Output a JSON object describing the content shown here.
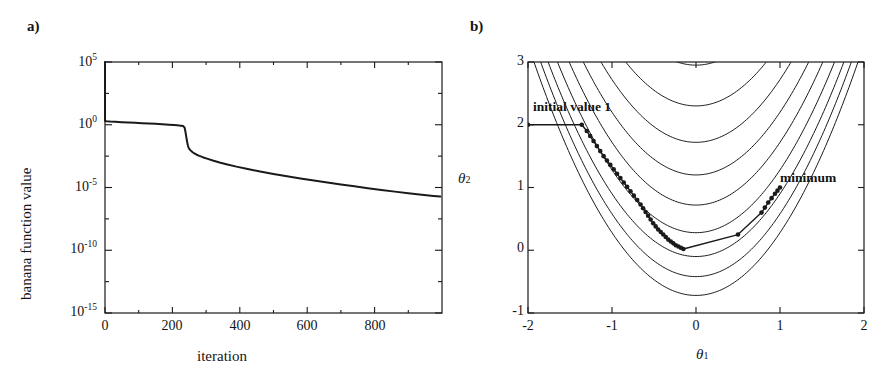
{
  "figure": {
    "background": "#ffffff",
    "ink_color": "#1a1a1a"
  },
  "panels": [
    {
      "key": "a",
      "label": "a)",
      "xlabel": "iteration",
      "ylabel": "banana function value"
    },
    {
      "key": "b",
      "label": "b)",
      "xlabel": "θ",
      "xlabel_sub": "1",
      "ylabel": "θ",
      "ylabel_sub": "2"
    }
  ],
  "annotations": {
    "initial_value": "initial value 1",
    "minimum": "minimum"
  },
  "chart_data": [
    {
      "type": "line",
      "panel": "a",
      "title": "a)",
      "xlabel": "iteration",
      "ylabel": "banana function value",
      "xlim": [
        0,
        1000
      ],
      "ylim": [
        1e-15,
        100000.0
      ],
      "yscale": "log",
      "xscale": "linear",
      "grid": false,
      "legend": null,
      "xticks": [
        0,
        200,
        400,
        600,
        800
      ],
      "xticklabels": [
        "0",
        "200",
        "400",
        "600",
        "800"
      ],
      "yticks": [
        100000.0,
        1,
        1e-05,
        1e-10,
        1e-15
      ],
      "yticklabels": [
        "10^5",
        "10^0",
        "10^-5",
        "10^-10",
        "10^-15"
      ],
      "minor_yticks_per_decade": 1,
      "series": [
        {
          "name": "banana function value",
          "x": [
            0,
            5,
            15,
            30,
            50,
            70,
            90,
            110,
            130,
            150,
            170,
            190,
            205,
            215,
            225,
            232,
            236,
            238,
            240,
            242,
            244,
            246,
            248,
            250,
            253,
            256,
            260,
            265,
            272,
            280,
            290,
            305,
            320,
            340,
            360,
            390,
            420,
            460,
            500,
            540,
            580,
            620,
            660,
            700,
            740,
            780,
            820,
            860,
            900,
            940,
            975,
            995
          ],
          "y": [
            2.0,
            1.9,
            1.8,
            1.7,
            1.6,
            1.5,
            1.42,
            1.34,
            1.26,
            1.18,
            1.1,
            1.02,
            0.95,
            0.9,
            0.84,
            0.78,
            0.6,
            0.35,
            0.17,
            0.08,
            0.04,
            0.022,
            0.015,
            0.012,
            0.0095,
            0.008,
            0.0065,
            0.0052,
            0.0041,
            0.0033,
            0.0026,
            0.0019,
            0.0014,
            0.00098,
            0.00072,
            0.00046,
            0.00031,
            0.00019,
            0.00012,
            7.9e-05,
            5.3e-05,
            3.6e-05,
            2.5e-05,
            1.75e-05,
            1.24e-05,
            8.9e-06,
            6.4e-06,
            4.7e-06,
            3.5e-06,
            2.6e-06,
            2.1e-06,
            1.9e-06
          ]
        }
      ]
    },
    {
      "type": "contour",
      "panel": "b",
      "title": "b)",
      "xlabel": "θ₁",
      "ylabel": "θ₂",
      "xlim": [
        -2,
        2
      ],
      "ylim": [
        -1,
        3
      ],
      "grid": false,
      "xticks": [
        -2,
        -1,
        0,
        1,
        2
      ],
      "xticklabels": [
        "-2",
        "-1",
        "0",
        "1",
        "2"
      ],
      "yticks": [
        -1,
        0,
        1,
        2,
        3
      ],
      "yticklabels": [
        "-1",
        "0",
        "1",
        "2",
        "3"
      ],
      "function": "rosenbrock-banana",
      "contour_offsets": [
        -0.72,
        -0.42,
        -0.1,
        0.28,
        0.72,
        1.2,
        1.72,
        2.3,
        2.95
      ],
      "contour_note": "level curves of form theta2 = theta1^2 + c",
      "overlay_path": {
        "name": "optimization trajectory",
        "marker": "filled-circle",
        "points": [
          [
            -2.0,
            2.0
          ],
          [
            -1.36,
            2.0
          ],
          [
            -1.3,
            1.9
          ],
          [
            -1.26,
            1.82
          ],
          [
            -1.22,
            1.74
          ],
          [
            -1.18,
            1.66
          ],
          [
            -1.14,
            1.58
          ],
          [
            -1.1,
            1.5
          ],
          [
            -1.06,
            1.43
          ],
          [
            -1.02,
            1.36
          ],
          [
            -0.98,
            1.29
          ],
          [
            -0.94,
            1.22
          ],
          [
            -0.9,
            1.15
          ],
          [
            -0.86,
            1.08
          ],
          [
            -0.82,
            1.01
          ],
          [
            -0.78,
            0.94
          ],
          [
            -0.74,
            0.87
          ],
          [
            -0.7,
            0.8
          ],
          [
            -0.66,
            0.73
          ],
          [
            -0.63,
            0.67
          ],
          [
            -0.6,
            0.61
          ],
          [
            -0.57,
            0.55
          ],
          [
            -0.54,
            0.49
          ],
          [
            -0.51,
            0.43
          ],
          [
            -0.48,
            0.38
          ],
          [
            -0.45,
            0.33
          ],
          [
            -0.42,
            0.29
          ],
          [
            -0.39,
            0.25
          ],
          [
            -0.36,
            0.21
          ],
          [
            -0.33,
            0.17
          ],
          [
            -0.3,
            0.14
          ],
          [
            -0.27,
            0.11
          ],
          [
            -0.24,
            0.08
          ],
          [
            -0.21,
            0.06
          ],
          [
            -0.18,
            0.04
          ],
          [
            -0.15,
            0.02
          ],
          [
            0.5,
            0.25
          ],
          [
            0.78,
            0.6
          ],
          [
            0.82,
            0.68
          ],
          [
            0.86,
            0.76
          ],
          [
            0.9,
            0.83
          ],
          [
            0.94,
            0.9
          ],
          [
            0.97,
            0.95
          ],
          [
            1.0,
            1.0
          ]
        ],
        "start_label": "initial value 1",
        "end_label": "minimum",
        "start_point": [
          -2.0,
          2.0
        ],
        "end_point": [
          1.0,
          1.0
        ]
      }
    }
  ]
}
